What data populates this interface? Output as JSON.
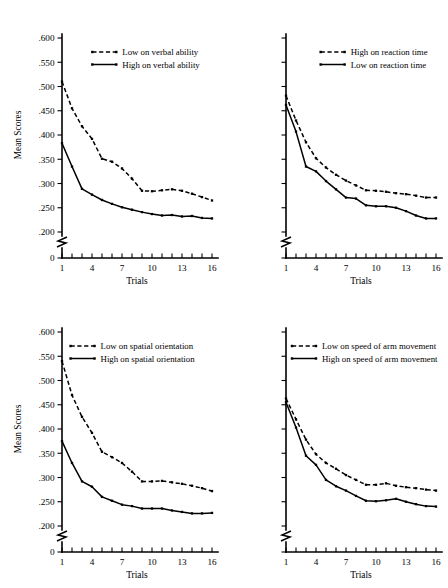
{
  "figure": {
    "title": "",
    "panel_count": 4
  },
  "axes": {
    "ylabel": "Mean Scores",
    "xlabel": "Trials",
    "ytick_labels": [
      ".600",
      ".550",
      ".500",
      ".450",
      ".400",
      ".350",
      ".300",
      ".250",
      ".200",
      "0"
    ],
    "ytick_values": [
      0.6,
      0.55,
      0.5,
      0.45,
      0.4,
      0.35,
      0.3,
      0.25,
      0.2,
      0
    ],
    "xtick_labels": [
      "1",
      "4",
      "7",
      "10",
      "13",
      "16"
    ],
    "xtick_values": [
      1,
      4,
      7,
      10,
      13,
      16
    ],
    "x_minor_count": 16,
    "axis_break": true,
    "ylim": [
      0.195,
      0.605
    ],
    "xlim": [
      1,
      16
    ],
    "grid": false
  },
  "chart_data": [
    {
      "id": "panel-verbal-ability",
      "position": "top-left",
      "type": "line",
      "title": "",
      "xlabel": "Trials",
      "ylabel": "Mean Scores",
      "ylim": [
        0.195,
        0.605
      ],
      "xlim": [
        1,
        16
      ],
      "grid": false,
      "legend_position": "top-right-inside",
      "x": [
        1,
        2,
        3,
        4,
        5,
        6,
        7,
        8,
        9,
        10,
        11,
        12,
        13,
        14,
        15,
        16
      ],
      "series": [
        {
          "name": "Low on verbal ability",
          "style": "dashed",
          "values": [
            0.51,
            0.455,
            0.418,
            0.392,
            0.351,
            0.345,
            0.331,
            0.31,
            0.285,
            0.284,
            0.286,
            0.288,
            0.285,
            0.279,
            0.272,
            0.265
          ]
        },
        {
          "name": "High on verbal ability",
          "style": "solid",
          "values": [
            0.383,
            0.335,
            0.289,
            0.277,
            0.266,
            0.258,
            0.251,
            0.246,
            0.241,
            0.237,
            0.234,
            0.235,
            0.232,
            0.233,
            0.229,
            0.228
          ]
        }
      ]
    },
    {
      "id": "panel-reaction-time",
      "position": "top-right",
      "type": "line",
      "title": "",
      "xlabel": "Trials",
      "ylabel": "",
      "ylim": [
        0.195,
        0.605
      ],
      "xlim": [
        1,
        16
      ],
      "grid": false,
      "legend_position": "top-right-inside",
      "x": [
        1,
        2,
        3,
        4,
        5,
        6,
        7,
        8,
        9,
        10,
        11,
        12,
        13,
        14,
        15,
        16
      ],
      "series": [
        {
          "name": "High on reaction time",
          "style": "dashed",
          "values": [
            0.481,
            0.43,
            0.385,
            0.352,
            0.333,
            0.318,
            0.306,
            0.296,
            0.286,
            0.285,
            0.283,
            0.28,
            0.278,
            0.275,
            0.271,
            0.271
          ]
        },
        {
          "name": "Low on reaction time",
          "style": "solid",
          "values": [
            0.462,
            0.407,
            0.335,
            0.325,
            0.305,
            0.288,
            0.271,
            0.269,
            0.255,
            0.253,
            0.253,
            0.25,
            0.243,
            0.234,
            0.228,
            0.228
          ]
        }
      ]
    },
    {
      "id": "panel-spatial-orientation",
      "position": "bottom-left",
      "type": "line",
      "title": "",
      "xlabel": "Trials",
      "ylabel": "Mean Scores",
      "ylim": [
        0.195,
        0.605
      ],
      "xlim": [
        1,
        16
      ],
      "grid": false,
      "legend_position": "top-right-inside",
      "x": [
        1,
        2,
        3,
        4,
        5,
        6,
        7,
        8,
        9,
        10,
        11,
        12,
        13,
        14,
        15,
        16
      ],
      "series": [
        {
          "name": "Low on spatial orientation",
          "style": "dashed",
          "values": [
            0.54,
            0.47,
            0.425,
            0.392,
            0.353,
            0.342,
            0.33,
            0.312,
            0.292,
            0.292,
            0.293,
            0.29,
            0.287,
            0.283,
            0.278,
            0.272
          ]
        },
        {
          "name": "High on spatial orientation",
          "style": "solid",
          "values": [
            0.375,
            0.33,
            0.292,
            0.281,
            0.26,
            0.252,
            0.244,
            0.241,
            0.236,
            0.236,
            0.236,
            0.232,
            0.229,
            0.226,
            0.226,
            0.227
          ]
        }
      ]
    },
    {
      "id": "panel-speed-arm-movement",
      "position": "bottom-right",
      "type": "line",
      "title": "",
      "xlabel": "Trials",
      "ylabel": "",
      "ylim": [
        0.195,
        0.605
      ],
      "xlim": [
        1,
        16
      ],
      "grid": false,
      "legend_position": "top-right-inside",
      "x": [
        1,
        2,
        3,
        4,
        5,
        6,
        7,
        8,
        9,
        10,
        11,
        12,
        13,
        14,
        15,
        16
      ],
      "series": [
        {
          "name": "Low on speed of arm movement",
          "style": "dashed",
          "values": [
            0.463,
            0.42,
            0.378,
            0.348,
            0.33,
            0.318,
            0.305,
            0.295,
            0.285,
            0.285,
            0.288,
            0.283,
            0.28,
            0.278,
            0.275,
            0.273
          ]
        },
        {
          "name": "High on speed of arm movement",
          "style": "solid",
          "values": [
            0.455,
            0.403,
            0.345,
            0.326,
            0.295,
            0.282,
            0.273,
            0.262,
            0.252,
            0.251,
            0.253,
            0.256,
            0.25,
            0.245,
            0.241,
            0.24
          ]
        }
      ]
    }
  ],
  "colors": {
    "ink": "#000000",
    "background": "#ffffff"
  }
}
